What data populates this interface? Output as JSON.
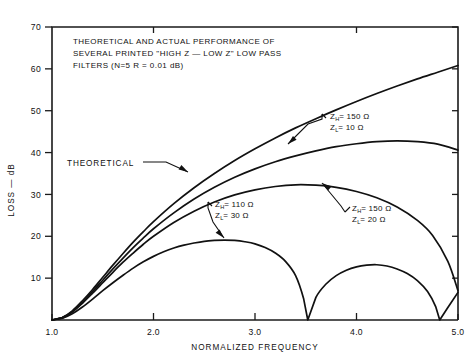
{
  "chart_data": {
    "type": "line",
    "title": "THEORETICAL AND ACTUAL PERFORMANCE OF SEVERAL PRINTED \"HIGH Z — LOW Z\" LOW PASS FILTERS (N=5  R = 0.01 dB)",
    "title_lines": [
      "THEORETICAL AND ACTUAL PERFORMANCE OF",
      "SEVERAL PRINTED \"HIGH Z — LOW Z\" LOW PASS",
      "FILTERS (N=5  R = 0.01 dB)"
    ],
    "xlabel": "NORMALIZED FREQUENCY",
    "ylabel": "LOSS — dB",
    "xlim": [
      1.0,
      5.0
    ],
    "ylim": [
      0,
      70
    ],
    "xticks": [
      1.0,
      2.0,
      3.0,
      4.0,
      5.0
    ],
    "xtick_labels": [
      "1.0",
      "2.0",
      "3.0",
      "4.0",
      "5.0"
    ],
    "yticks": [
      10,
      20,
      30,
      40,
      50,
      60,
      70
    ],
    "ytick_labels": [
      "10",
      "20",
      "30",
      "40",
      "50",
      "60",
      "70"
    ],
    "grid": false,
    "legend": "annotations",
    "series": [
      {
        "name": "THEORETICAL",
        "label": "THEORETICAL",
        "points": [
          [
            1.0,
            0.0
          ],
          [
            1.1,
            0.6
          ],
          [
            1.2,
            2.2
          ],
          [
            1.3,
            4.6
          ],
          [
            1.4,
            7.3
          ],
          [
            1.5,
            10.2
          ],
          [
            1.6,
            13.1
          ],
          [
            1.7,
            15.9
          ],
          [
            1.8,
            18.6
          ],
          [
            1.9,
            21.1
          ],
          [
            2.0,
            23.5
          ],
          [
            2.2,
            27.8
          ],
          [
            2.4,
            31.6
          ],
          [
            2.6,
            35.0
          ],
          [
            2.8,
            38.1
          ],
          [
            3.0,
            40.9
          ],
          [
            3.2,
            43.5
          ],
          [
            3.4,
            45.9
          ],
          [
            3.6,
            48.1
          ],
          [
            3.8,
            50.2
          ],
          [
            4.0,
            52.2
          ],
          [
            4.2,
            54.1
          ],
          [
            4.4,
            55.9
          ],
          [
            4.6,
            57.6
          ],
          [
            4.8,
            59.2
          ],
          [
            5.0,
            60.8
          ]
        ]
      },
      {
        "name": "ZH150_ZL10",
        "label_lines": [
          "Z_H = 150 Ω",
          "Z_L = 10 Ω"
        ],
        "z_high": "150 Ω",
        "z_low": "10 Ω",
        "points": [
          [
            1.0,
            0.0
          ],
          [
            1.1,
            0.5
          ],
          [
            1.2,
            2.0
          ],
          [
            1.3,
            4.2
          ],
          [
            1.4,
            6.8
          ],
          [
            1.5,
            9.5
          ],
          [
            1.6,
            12.2
          ],
          [
            1.7,
            14.8
          ],
          [
            1.8,
            17.3
          ],
          [
            1.9,
            19.6
          ],
          [
            2.0,
            21.8
          ],
          [
            2.2,
            25.6
          ],
          [
            2.4,
            28.9
          ],
          [
            2.6,
            31.7
          ],
          [
            2.8,
            34.1
          ],
          [
            3.0,
            36.1
          ],
          [
            3.2,
            37.8
          ],
          [
            3.4,
            39.2
          ],
          [
            3.6,
            40.4
          ],
          [
            3.8,
            41.4
          ],
          [
            4.0,
            42.1
          ],
          [
            4.2,
            42.6
          ],
          [
            4.4,
            42.8
          ],
          [
            4.6,
            42.6
          ],
          [
            4.8,
            42.0
          ],
          [
            5.0,
            40.6
          ]
        ]
      },
      {
        "name": "ZH150_ZL20",
        "label_lines": [
          "Z_H = 150 Ω",
          "Z_L = 20 Ω"
        ],
        "z_high": "150 Ω",
        "z_low": "20 Ω",
        "points": [
          [
            1.0,
            0.0
          ],
          [
            1.1,
            0.5
          ],
          [
            1.2,
            1.9
          ],
          [
            1.3,
            4.0
          ],
          [
            1.4,
            6.4
          ],
          [
            1.5,
            8.9
          ],
          [
            1.6,
            11.4
          ],
          [
            1.7,
            13.8
          ],
          [
            1.8,
            16.0
          ],
          [
            1.9,
            18.1
          ],
          [
            2.0,
            20.0
          ],
          [
            2.2,
            23.3
          ],
          [
            2.4,
            26.0
          ],
          [
            2.6,
            28.2
          ],
          [
            2.8,
            29.9
          ],
          [
            3.0,
            31.1
          ],
          [
            3.2,
            31.9
          ],
          [
            3.4,
            32.3
          ],
          [
            3.6,
            32.2
          ],
          [
            3.8,
            31.7
          ],
          [
            4.0,
            30.7
          ],
          [
            4.2,
            29.2
          ],
          [
            4.4,
            27.0
          ],
          [
            4.6,
            23.8
          ],
          [
            4.75,
            20.2
          ],
          [
            4.9,
            14.0
          ],
          [
            5.0,
            7.0
          ]
        ]
      },
      {
        "name": "ZH110_ZL30",
        "label_lines": [
          "Z_H = 110 Ω",
          "Z_L = 30 Ω"
        ],
        "z_high": "110 Ω",
        "z_low": "30 Ω",
        "points": [
          [
            1.0,
            0.0
          ],
          [
            1.1,
            0.4
          ],
          [
            1.2,
            1.5
          ],
          [
            1.3,
            3.1
          ],
          [
            1.4,
            5.0
          ],
          [
            1.5,
            7.0
          ],
          [
            1.6,
            8.9
          ],
          [
            1.7,
            10.7
          ],
          [
            1.8,
            12.4
          ],
          [
            1.9,
            13.9
          ],
          [
            2.0,
            15.2
          ],
          [
            2.1,
            16.3
          ],
          [
            2.2,
            17.2
          ],
          [
            2.3,
            17.9
          ],
          [
            2.4,
            18.4
          ],
          [
            2.5,
            18.8
          ],
          [
            2.6,
            19.0
          ],
          [
            2.7,
            19.1
          ],
          [
            2.8,
            19.0
          ],
          [
            2.9,
            18.7
          ],
          [
            3.0,
            18.2
          ],
          [
            3.1,
            17.3
          ],
          [
            3.2,
            16.0
          ],
          [
            3.3,
            14.0
          ],
          [
            3.4,
            10.6
          ],
          [
            3.48,
            5.0
          ],
          [
            3.52,
            0.0
          ],
          [
            3.6,
            5.4
          ],
          [
            3.7,
            8.6
          ],
          [
            3.8,
            10.6
          ],
          [
            3.9,
            11.9
          ],
          [
            4.0,
            12.7
          ],
          [
            4.1,
            13.1
          ],
          [
            4.2,
            13.2
          ],
          [
            4.3,
            12.9
          ],
          [
            4.4,
            12.2
          ],
          [
            4.5,
            11.1
          ],
          [
            4.6,
            9.4
          ],
          [
            4.7,
            6.8
          ],
          [
            4.78,
            3.2
          ],
          [
            4.82,
            0.0
          ],
          [
            4.9,
            3.0
          ],
          [
            5.0,
            6.6
          ]
        ]
      }
    ],
    "annotations": [
      {
        "name": "theoretical",
        "text": "THEORETICAL"
      },
      {
        "name": "zh150-zl10",
        "line1": "= 150 Ω",
        "line2": "= 10 Ω",
        "sub1": "H",
        "sub2": "L",
        "sym": "Z"
      },
      {
        "name": "zh150-zl20",
        "line1": "= 150 Ω",
        "line2": "= 20 Ω",
        "sub1": "H",
        "sub2": "L",
        "sym": "Z"
      },
      {
        "name": "zh110-zl30",
        "line1": "= 110 Ω",
        "line2": "= 30 Ω",
        "sub1": "H",
        "sub2": "L",
        "sym": "Z"
      }
    ],
    "colors": {
      "ink": "#111111",
      "background": "#ffffff"
    }
  }
}
